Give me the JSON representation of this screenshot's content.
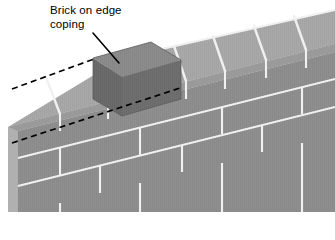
{
  "figure": {
    "title": "Brick on edge coping",
    "label": {
      "line1": "Brick on edge",
      "line2": "coping",
      "text": "Brick on edge\ncoping"
    },
    "colors": {
      "background": "#ffffff",
      "mortar": "#f0f0f0",
      "coping_top": "#a9a9a9",
      "coping_front": "#9a9a9a",
      "coping_end": "#b4b4b4",
      "wall_top": "#a4a4a4",
      "wall_face": "#8f8f8f",
      "wall_end": "#b0b0b0",
      "highlight_top": "#8c8c8c",
      "highlight_front": "#6b6b6b",
      "highlight_end": "#5f5f5f",
      "leader_line": "#000000",
      "dashed_line": "#000000"
    },
    "annotations": {
      "leader_line": "solid-leader-line",
      "upper_dashed_line": "dashed-alignment-line-upper",
      "lower_dashed_line": "dashed-alignment-line-lower"
    },
    "geometry": {
      "view": "isometric",
      "coping_course_bricks": 7,
      "wall_courses": 3,
      "highlighted_brick_index": 1
    }
  }
}
